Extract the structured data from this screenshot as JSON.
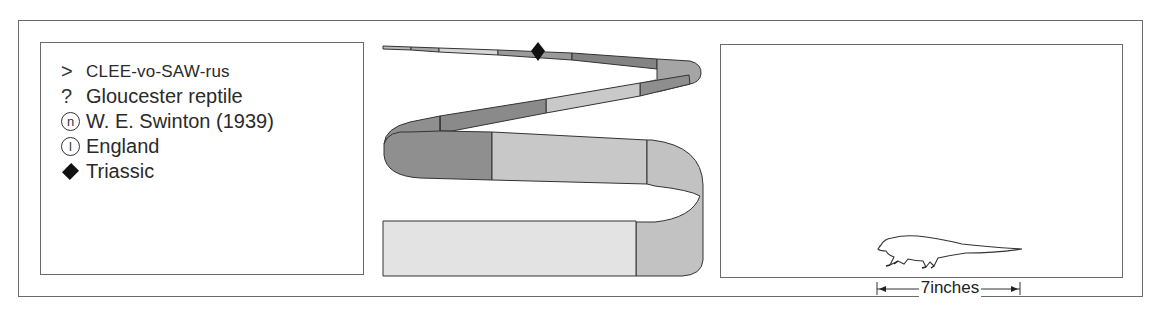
{
  "facts": [
    {
      "symbol": ">",
      "symbol_icon": "pronunciation-icon",
      "text": "CLEE-vo-SAW-rus",
      "kind": "pronunciation"
    },
    {
      "symbol": "?",
      "symbol_icon": "meaning-icon",
      "text": "Gloucester reptile",
      "kind": "meaning"
    },
    {
      "symbol": "n",
      "symbol_icon": "named-by-icon",
      "text": "W. E. Swinton (1939)",
      "kind": "named_by"
    },
    {
      "symbol": "l",
      "symbol_icon": "location-icon",
      "text": "England",
      "kind": "location"
    },
    {
      "symbol": "◆",
      "symbol_icon": "period-diamond-icon",
      "text": "Triassic",
      "kind": "period"
    }
  ],
  "timeline": {
    "marker": "diamond",
    "marker_color": "#111111",
    "segment_colors": [
      "#b8b8b8",
      "#a7a7a7",
      "#d6d6d6",
      "#9a9a9a",
      "#8c8c8c",
      "#838383",
      "#a5a5a5",
      "#8e8e8e",
      "#c9c9c9",
      "#8a8a8a",
      "#8f8f8f",
      "#c8c8c8",
      "#d2d2d2",
      "#e3e3e3",
      "#c2c2c2"
    ]
  },
  "size": {
    "scale_label": "7inches",
    "animal": "reptile-silhouette"
  }
}
